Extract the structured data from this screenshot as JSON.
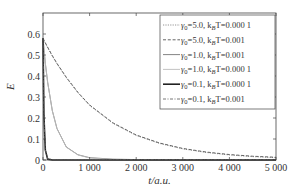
{
  "chart_data": {
    "type": "line",
    "title": "",
    "xlabel": "t/a.u.",
    "ylabel": "E",
    "xlim": [
      0,
      5000
    ],
    "ylim": [
      0,
      0.7
    ],
    "xticks": [
      0,
      1000,
      2000,
      3000,
      4000,
      5000
    ],
    "xtick_labels": [
      "0",
      "1 000",
      "2 000",
      "3 000",
      "4 000",
      "5 000"
    ],
    "yticks": [
      0,
      0.1,
      0.2,
      0.3,
      0.4,
      0.5,
      0.6
    ],
    "ytick_labels": [
      "0",
      "0.1",
      "0.2",
      "0.3",
      "0.4",
      "0.5",
      "0.6"
    ],
    "grid": false,
    "legend_position": "top-right",
    "x": [
      0,
      20,
      50,
      100,
      200,
      300,
      500,
      750,
      1000,
      1500,
      2000,
      2500,
      3000,
      3500,
      4000,
      4500,
      5000
    ],
    "series": [
      {
        "name": "γ0=5.0, kBT=0.000 1",
        "legend_label": "γ0=5.0, kBT=0.000 1",
        "style": "dotted",
        "color": "#888888",
        "values": [
          0.58,
          0.57,
          0.556,
          0.535,
          0.495,
          0.458,
          0.392,
          0.32,
          0.26,
          0.175,
          0.117,
          0.079,
          0.053,
          0.036,
          0.024,
          0.016,
          0.011
        ]
      },
      {
        "name": "γ0=5.0, kBT=0.001",
        "legend_label": "γ0=5.0, kBT=0.001",
        "style": "dashed",
        "color": "#555555",
        "values": [
          0.58,
          0.571,
          0.558,
          0.537,
          0.497,
          0.46,
          0.394,
          0.322,
          0.262,
          0.177,
          0.119,
          0.081,
          0.055,
          0.038,
          0.026,
          0.018,
          0.013
        ]
      },
      {
        "name": "γ0=1.0, kBT=0.001",
        "legend_label": "γ0=1.0, kBT=0.001",
        "style": "solid",
        "color": "#777777",
        "values": [
          0.58,
          0.53,
          0.46,
          0.37,
          0.235,
          0.15,
          0.062,
          0.025,
          0.011,
          0.004,
          0.002,
          0.002,
          0.002,
          0.002,
          0.002,
          0.002,
          0.002
        ]
      },
      {
        "name": "γ0=1.0, kBT=0.000 1",
        "legend_label": "γ0=1.0, kBT=0.000 1",
        "style": "solid",
        "color": "#bbbbbb",
        "values": [
          0.58,
          0.53,
          0.46,
          0.369,
          0.234,
          0.149,
          0.061,
          0.024,
          0.01,
          0.002,
          0.0,
          0.0,
          0.0,
          0.0,
          0.0,
          0.0,
          0.0
        ]
      },
      {
        "name": "γ0=0.1, kBT=0.000 1",
        "legend_label": "γ0=0.1, kBT=0.000 1",
        "style": "solid-thick",
        "color": "#222222",
        "values": [
          0.58,
          0.21,
          0.047,
          0.004,
          0.0,
          0.0,
          0.0,
          0.0,
          0.0,
          0.0,
          0.0,
          0.0,
          0.0,
          0.0,
          0.0,
          0.0,
          0.0
        ]
      },
      {
        "name": "γ0=0.1, kBT=0.001",
        "legend_label": "γ0=0.1, kBT=0.001",
        "style": "dashdot",
        "color": "#666666",
        "values": [
          0.58,
          0.212,
          0.049,
          0.006,
          0.002,
          0.002,
          0.002,
          0.002,
          0.002,
          0.002,
          0.002,
          0.002,
          0.002,
          0.002,
          0.002,
          0.002,
          0.002
        ]
      }
    ]
  },
  "legend": [
    {
      "gamma_label": "γ",
      "gamma_sub": "0",
      "gamma_val": "=5.0, k",
      "k_sub": "B",
      "tail": "T=0.000 1"
    },
    {
      "gamma_label": "γ",
      "gamma_sub": "0",
      "gamma_val": "=5.0, k",
      "k_sub": "B",
      "tail": "T=0.001"
    },
    {
      "gamma_label": "γ",
      "gamma_sub": "0",
      "gamma_val": "=1.0, k",
      "k_sub": "B",
      "tail": "T=0.001"
    },
    {
      "gamma_label": "γ",
      "gamma_sub": "0",
      "gamma_val": "=1.0, k",
      "k_sub": "B",
      "tail": "T=0.000 1"
    },
    {
      "gamma_label": "γ",
      "gamma_sub": "0",
      "gamma_val": "=0.1, k",
      "k_sub": "B",
      "tail": "T=0.000 1"
    },
    {
      "gamma_label": "γ",
      "gamma_sub": "0",
      "gamma_val": "=0.1, k",
      "k_sub": "B",
      "tail": "T=0.001"
    }
  ]
}
